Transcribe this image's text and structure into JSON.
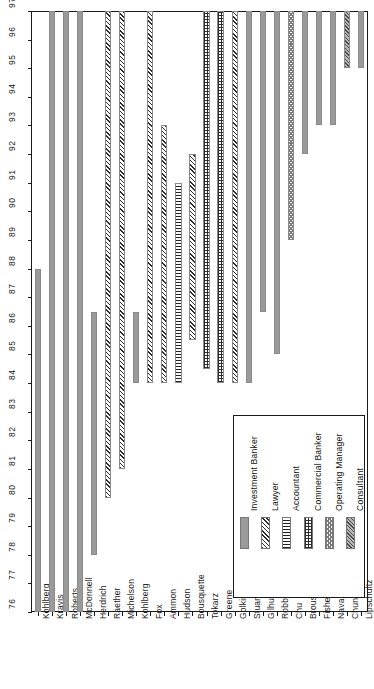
{
  "chart_data": {
    "type": "bar",
    "orientation": "vertical-gantt",
    "title": "",
    "subtitle": "",
    "xlabel": "",
    "ylabel": "",
    "ylim": [
      76,
      97
    ],
    "grid": false,
    "yticks": [
      76,
      77,
      78,
      79,
      80,
      81,
      82,
      83,
      84,
      85,
      86,
      87,
      88,
      89,
      90,
      91,
      92,
      93,
      94,
      95,
      96,
      97
    ],
    "ytick_labels": [
      "76",
      "77",
      "78",
      "79",
      "80",
      "81",
      "82",
      "83",
      "84",
      "85",
      "86",
      "87",
      "88",
      "89",
      "90",
      "91",
      "92",
      "93",
      "94",
      "95",
      "96",
      "97"
    ],
    "categories": [
      "Kohlberg",
      "Kravis",
      "Roberts",
      "McDonnell",
      "Herdrich",
      "Raether",
      "Michelson",
      "Kohlberg",
      "Fox",
      "Ammon",
      "Hudson",
      "Bousquette",
      "Tokarz",
      "Greene",
      "Golkin",
      "Stuart",
      "Gilhuly",
      "Robbins",
      "Chu",
      "Brous",
      "Fisher",
      "Navab",
      "Chung",
      "Lipschultz"
    ],
    "legend_position": "lower-right",
    "legend_entries": [
      {
        "label": "Investment Banker",
        "pattern": "solid-gray",
        "key": "ib"
      },
      {
        "label": "Lawyer",
        "pattern": "diagonal-hatch",
        "key": "law"
      },
      {
        "label": "Accountant",
        "pattern": "horizontal-lines",
        "key": "acct"
      },
      {
        "label": "Commercial Banker",
        "pattern": "cross-grid",
        "key": "cb"
      },
      {
        "label": "Operating Manager",
        "pattern": "diamond-checker",
        "key": "om"
      },
      {
        "label": "Consultant",
        "pattern": "dense-diagonal",
        "key": "cons"
      }
    ],
    "bars": [
      {
        "name": "Kohlberg",
        "start": 76.0,
        "end": 88.0,
        "role": "Investment Banker",
        "key": "ib"
      },
      {
        "name": "Kravis",
        "start": 76.0,
        "end": 97.0,
        "role": "Investment Banker",
        "key": "ib"
      },
      {
        "name": "Roberts",
        "start": 76.0,
        "end": 97.0,
        "role": "Investment Banker",
        "key": "ib"
      },
      {
        "name": "McDonnell",
        "start": 76.0,
        "end": 97.0,
        "role": "Investment Banker",
        "key": "ib"
      },
      {
        "name": "Herdrich",
        "start": 78.0,
        "end": 86.5,
        "role": "Investment Banker",
        "key": "ib"
      },
      {
        "name": "Raether",
        "start": 80.0,
        "end": 97.0,
        "role": "Lawyer",
        "key": "law"
      },
      {
        "name": "Michelson",
        "start": 81.0,
        "end": 97.0,
        "role": "Lawyer",
        "key": "law"
      },
      {
        "name": "Kohlberg",
        "start": 84.0,
        "end": 86.5,
        "role": "Investment Banker",
        "key": "ib"
      },
      {
        "name": "Fox",
        "start": 84.0,
        "end": 97.0,
        "role": "Lawyer",
        "key": "law"
      },
      {
        "name": "Ammon",
        "start": 84.0,
        "end": 93.0,
        "role": "Lawyer",
        "key": "law"
      },
      {
        "name": "Hudson",
        "start": 84.0,
        "end": 91.0,
        "role": "Accountant",
        "key": "acct"
      },
      {
        "name": "Bousquette",
        "start": 85.5,
        "end": 92.0,
        "role": "Lawyer",
        "key": "law"
      },
      {
        "name": "Tokarz",
        "start": 84.5,
        "end": 97.0,
        "role": "Commercial Banker",
        "key": "cb"
      },
      {
        "name": "Greene",
        "start": 84.0,
        "end": 97.0,
        "role": "Commercial Banker",
        "key": "cb"
      },
      {
        "name": "Golkin",
        "start": 84.0,
        "end": 97.0,
        "role": "Lawyer",
        "key": "law"
      },
      {
        "name": "Stuart",
        "start": 84.0,
        "end": 97.0,
        "role": "Investment Banker",
        "key": "ib"
      },
      {
        "name": "Gilhuly",
        "start": 86.5,
        "end": 97.0,
        "role": "Investment Banker",
        "key": "ib"
      },
      {
        "name": "Robbins",
        "start": 85.0,
        "end": 97.0,
        "role": "Investment Banker",
        "key": "ib"
      },
      {
        "name": "Chu",
        "start": 89.0,
        "end": 97.0,
        "role": "Operating Manager",
        "key": "om"
      },
      {
        "name": "Brous",
        "start": 92.0,
        "end": 97.0,
        "role": "Investment Banker",
        "key": "ib"
      },
      {
        "name": "Fisher",
        "start": 93.0,
        "end": 97.0,
        "role": "Investment Banker",
        "key": "ib"
      },
      {
        "name": "Navab",
        "start": 93.0,
        "end": 97.0,
        "role": "Investment Banker",
        "key": "ib"
      },
      {
        "name": "Chung",
        "start": 95.0,
        "end": 97.0,
        "role": "Consultant",
        "key": "cons"
      },
      {
        "name": "Lipschultz",
        "start": 95.0,
        "end": 97.0,
        "role": "Investment Banker",
        "key": "ib"
      }
    ]
  },
  "colors": {
    "axis": "#1a1a1a",
    "investment_banker": "#9a9a9a",
    "hatch_dark": "#2b2b2b",
    "plot_background": "#ffffff"
  }
}
